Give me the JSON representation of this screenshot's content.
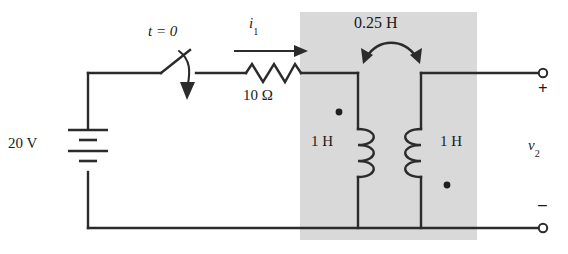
{
  "figure": {
    "background_color": "#ffffff",
    "wire_color": "#2b2b2b",
    "shaded_region_color": "#d9d9d9"
  },
  "labels": {
    "switch_time": "t = 0",
    "current_1": "i",
    "current_1_sub": "1",
    "resistor_value": "10 Ω",
    "mutual_inductance": "0.25 H",
    "source_value": "20 V",
    "inductor_1_value": "1 H",
    "inductor_2_value": "1 H",
    "output_voltage": "v",
    "output_voltage_sub": "2",
    "terminal_positive": "+",
    "terminal_negative": "−"
  },
  "components": {
    "voltage_source": {
      "name": "dc-voltage-source",
      "value": "20 V",
      "type": "battery"
    },
    "switch": {
      "name": "switch",
      "state": "open",
      "closes_at": "t = 0"
    },
    "resistor": {
      "name": "resistor",
      "value": "10 Ω"
    },
    "inductor_primary": {
      "name": "inductor-primary",
      "value": "1 H",
      "dot_position": "top-left"
    },
    "inductor_secondary": {
      "name": "inductor-secondary",
      "value": "1 H",
      "dot_position": "bottom-right"
    },
    "mutual_coupling": {
      "name": "mutual-inductance",
      "value": "0.25 H"
    },
    "output_terminals": {
      "name": "output-terminals",
      "positive": "+",
      "negative": "−",
      "voltage": "v2"
    }
  }
}
